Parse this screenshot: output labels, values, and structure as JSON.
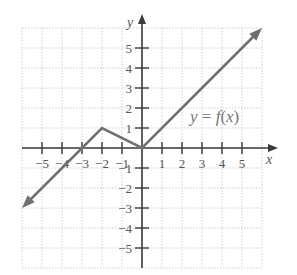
{
  "chart_data": {
    "type": "line",
    "title": "",
    "xlabel": "x",
    "ylabel": "y",
    "xlim": [
      -6,
      6
    ],
    "ylim": [
      -6,
      6
    ],
    "grid": true,
    "x_ticks": [
      -5,
      -4,
      -3,
      -2,
      -1,
      1,
      2,
      3,
      4,
      5
    ],
    "y_ticks": [
      -5,
      -4,
      -3,
      -2,
      -1,
      1,
      2,
      3,
      4,
      5
    ],
    "x_tick_labels": [
      "−5",
      "−4",
      "−3",
      "−2",
      "−1",
      "1",
      "2",
      "3",
      "4",
      "5"
    ],
    "y_tick_labels": [
      "−5",
      "−4",
      "−3",
      "−2",
      "−1",
      "1",
      "2",
      "3",
      "4",
      "5"
    ],
    "series": [
      {
        "name": "y = f(x)",
        "x": [
          -6,
          -2,
          0,
          6
        ],
        "y": [
          -3,
          1,
          0,
          6
        ],
        "arrows": [
          "start",
          "end"
        ],
        "color": "#707070"
      }
    ],
    "annotations": [
      {
        "text": "y = f(x)",
        "x": 3.6,
        "y": 1.5
      }
    ]
  },
  "labels": {
    "x_axis": "x",
    "y_axis": "y",
    "function": "y = f(x)"
  },
  "colors": {
    "axis": "#3a3a3a",
    "grid": "#d0d0d0",
    "curve": "#707070",
    "text": "#555555"
  }
}
